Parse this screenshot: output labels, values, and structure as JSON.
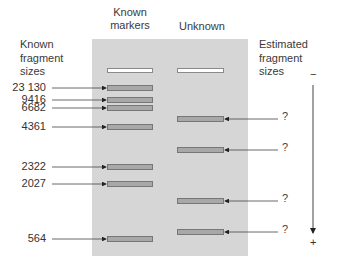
{
  "headers": {
    "known_markers": "Known\nmarkers",
    "unknown": "Unknown",
    "known_sizes": "Known\nfragment\nsizes",
    "estimated_sizes": "Estimated\nfragment\nsizes"
  },
  "markers": [
    {
      "label": "23 130",
      "y": 88
    },
    {
      "label": "9416",
      "y": 100
    },
    {
      "label": "6682",
      "y": 108
    },
    {
      "label": "4361",
      "y": 127
    },
    {
      "label": "2322",
      "y": 167
    },
    {
      "label": "2027",
      "y": 184
    },
    {
      "label": "564",
      "y": 239
    }
  ],
  "unknowns": [
    {
      "label": "?",
      "y": 119
    },
    {
      "label": "?",
      "y": 150
    },
    {
      "label": "?",
      "y": 201
    },
    {
      "label": "?",
      "y": 232
    }
  ],
  "electrode": {
    "negative": "−",
    "positive": "+"
  },
  "colors": {
    "gel": "#d6d6d6",
    "band": "#a8a8a8",
    "band_border": "#777777",
    "well": "#ffffff"
  }
}
